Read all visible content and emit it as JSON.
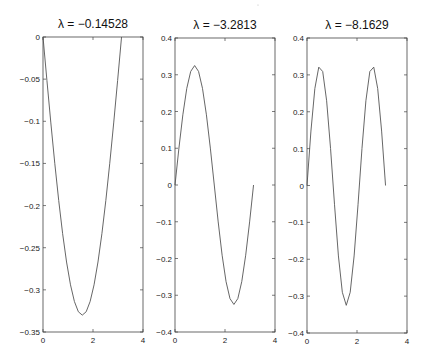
{
  "chart_data": [
    {
      "type": "line",
      "title": "λ = −0.14528",
      "xlabel": "",
      "ylabel": "",
      "xlim": [
        0,
        4
      ],
      "ylim": [
        -0.35,
        0
      ],
      "xticks": [
        "0",
        "2",
        "4"
      ],
      "yticks": [
        "0",
        "-0.05",
        "-0.1",
        "-0.15",
        "-0.2",
        "-0.25",
        "-0.3",
        "-0.35"
      ],
      "ytick_values": [
        0,
        -0.05,
        -0.1,
        -0.15,
        -0.2,
        -0.25,
        -0.3,
        -0.35
      ],
      "grid": false,
      "series": [
        {
          "name": "eigenfunction 1",
          "formula": "-0.33*sin(x)",
          "amp": -0.33,
          "k": 1
        }
      ]
    },
    {
      "type": "line",
      "title": "λ = −3.2813",
      "xlabel": "",
      "ylabel": "",
      "xlim": [
        0,
        4
      ],
      "ylim": [
        -0.4,
        0.4
      ],
      "xticks": [
        "0",
        "2",
        "4"
      ],
      "yticks": [
        "0.4",
        "0.3",
        "0.2",
        "0.1",
        "0",
        "-0.1",
        "-0.2",
        "-0.3",
        "-0.4"
      ],
      "ytick_values": [
        0.4,
        0.3,
        0.2,
        0.1,
        0,
        -0.1,
        -0.2,
        -0.3,
        -0.4
      ],
      "grid": false,
      "series": [
        {
          "name": "eigenfunction 2",
          "formula": "0.32*sin(2x)",
          "amp": 0.325,
          "k": 2
        }
      ]
    },
    {
      "type": "line",
      "title": "λ = −8.1629",
      "xlabel": "",
      "ylabel": "",
      "xlim": [
        0,
        4
      ],
      "ylim": [
        -0.4,
        0.4
      ],
      "xticks": [
        "0",
        "2",
        "4"
      ],
      "yticks": [
        "0.4",
        "0.3",
        "0.2",
        "0.1",
        "0",
        "-0.1",
        "-0.2",
        "-0.3",
        "-0.4"
      ],
      "ytick_values": [
        0.4,
        0.3,
        0.2,
        0.1,
        0,
        -0.1,
        -0.2,
        -0.3,
        -0.4
      ],
      "grid": false,
      "series": [
        {
          "name": "eigenfunction 3",
          "formula": "0.32*sin(3x)",
          "amp": 0.325,
          "k": 3
        }
      ]
    }
  ],
  "layout": {
    "panels": [
      {
        "left": 43,
        "right": 143,
        "top": 37,
        "bottom": 332
      },
      {
        "left": 175,
        "right": 275,
        "top": 38,
        "bottom": 332
      },
      {
        "left": 307,
        "right": 407,
        "top": 38,
        "bottom": 333
      }
    ],
    "samples": 21,
    "line_color": "#555555",
    "axis_color": "#444444"
  }
}
